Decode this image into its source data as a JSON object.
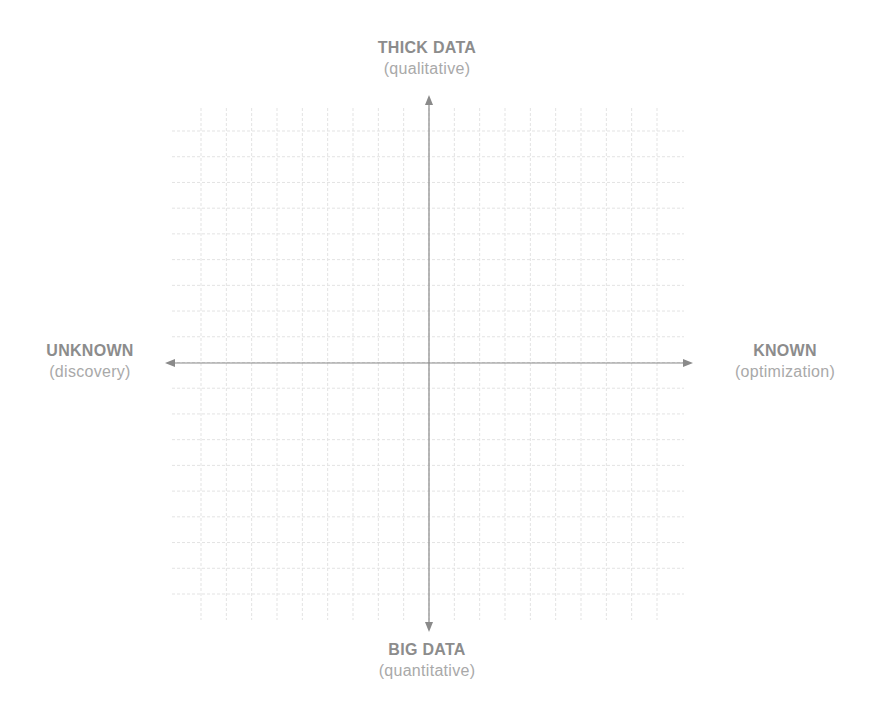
{
  "diagram": {
    "type": "quadrant-grid",
    "colors": {
      "grid": "#e3e3e3",
      "axis": "#8a8a8a",
      "title_text": "#8c8c8c",
      "subtitle_text": "#a9a9a9",
      "background": "#ffffff"
    },
    "axes": {
      "top": {
        "title": "THICK DATA",
        "subtitle": "(qualitative)"
      },
      "bottom": {
        "title": "BIG DATA",
        "subtitle": "(quantitative)"
      },
      "left": {
        "title": "UNKNOWN",
        "subtitle": "(discovery)"
      },
      "right": {
        "title": "KNOWN",
        "subtitle": "(optimization)"
      }
    },
    "grid": {
      "columns": 18,
      "rows": 18
    }
  }
}
